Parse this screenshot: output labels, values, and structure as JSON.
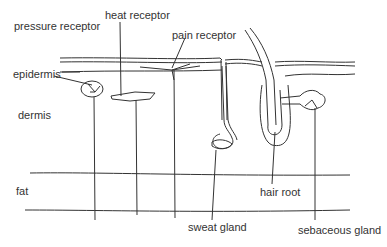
{
  "diagram": {
    "layers": {
      "epidermis": "epidermis",
      "dermis": "dermis",
      "fat": "fat"
    },
    "structures": {
      "pressure_receptor": "pressure receptor",
      "heat_receptor": "heat receptor",
      "pain_receptor": "pain receptor",
      "sweat_gland": "sweat gland",
      "hair_root": "hair root",
      "sebaceous_gland": "sebaceous gland"
    },
    "colors": {
      "line": "#333333",
      "background": "#ffffff"
    }
  }
}
